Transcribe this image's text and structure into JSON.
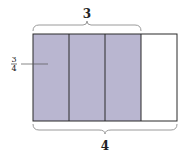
{
  "diagram": {
    "type": "fraction-area-model",
    "top_brace_label": "3",
    "bottom_brace_label": "4",
    "fraction": {
      "numerator": "3",
      "denominator": "4"
    },
    "total_parts": 4,
    "shaded_parts": 3,
    "colors": {
      "shaded": "#b9b6d0",
      "unshaded": "#ffffff",
      "outline": "#2a2a2a",
      "brace": "#9a9a9a",
      "leader": "#555555"
    }
  }
}
